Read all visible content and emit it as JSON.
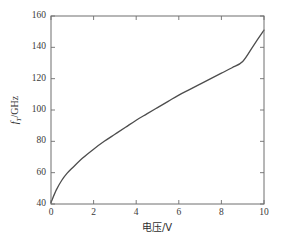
{
  "chart_data": {
    "type": "line",
    "title": "",
    "xlabel": "电压/V",
    "ylabel": "fT/GHz",
    "ylabel_parts": {
      "symbol": "f",
      "subscript": "T",
      "unit": "/GHz"
    },
    "xlim": [
      0,
      10
    ],
    "ylim": [
      40,
      160
    ],
    "xticks": [
      0,
      2,
      4,
      6,
      8,
      10
    ],
    "yticks": [
      40,
      60,
      80,
      100,
      120,
      140,
      160
    ],
    "xtick_labels": [
      "0",
      "2",
      "4",
      "6",
      "8",
      "10"
    ],
    "ytick_labels": [
      "40",
      "60",
      "80",
      "100",
      "120",
      "140",
      "160"
    ],
    "grid": false,
    "legend": null,
    "series": [
      {
        "name": "fT vs voltage",
        "color": "#4d4d4d",
        "linewidth": 1.3,
        "x": [
          0,
          0.25,
          0.5,
          0.75,
          1,
          1.5,
          2,
          2.5,
          3,
          3.5,
          4,
          4.5,
          5,
          5.5,
          6,
          6.5,
          7,
          7.5,
          8,
          8.5,
          9,
          9.5,
          10
        ],
        "y": [
          41,
          49,
          55,
          59.5,
          63,
          69.5,
          75,
          80,
          84.5,
          89,
          93.5,
          97.5,
          101.5,
          105.5,
          109.5,
          113,
          116.5,
          120,
          123.5,
          127,
          131,
          141,
          151
        ]
      }
    ],
    "box": {
      "left": 51,
      "top": 16,
      "right": 264,
      "bottom": 204
    },
    "tick_direction": "in",
    "spines": [
      "left",
      "right",
      "top",
      "bottom"
    ],
    "background": "#ffffff",
    "axis_color": "#6e6e6e"
  }
}
